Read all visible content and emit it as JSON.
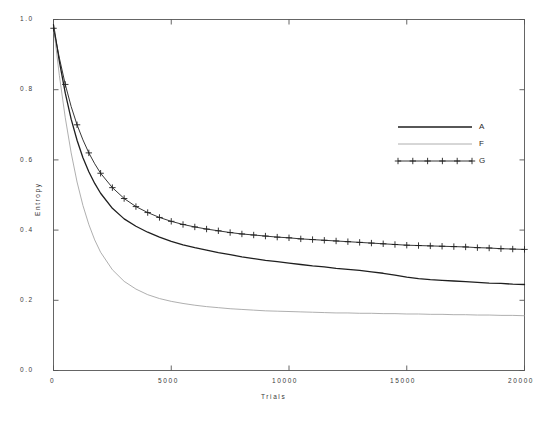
{
  "chart_data": {
    "type": "line",
    "title": "",
    "xlabel": "Trials",
    "ylabel": "Entropy",
    "xlim": [
      0,
      20000
    ],
    "ylim": [
      0.0,
      1.0
    ],
    "xticks": [
      0,
      5000,
      10000,
      15000,
      20000
    ],
    "xtick_labels": [
      "0",
      "5000",
      "10000",
      "15000",
      "20000"
    ],
    "yticks": [
      0.0,
      0.2,
      0.4,
      0.6,
      0.8,
      1.0
    ],
    "ytick_labels": [
      "0.0",
      "0.2",
      "0.4",
      "0.6",
      "0.8",
      "1.0"
    ],
    "grid": false,
    "legend_position": "upper right",
    "frame": true,
    "x": [
      0,
      250,
      500,
      750,
      1000,
      1250,
      1500,
      1750,
      2000,
      2500,
      3000,
      3500,
      4000,
      4500,
      5000,
      5500,
      6000,
      6500,
      7000,
      7500,
      8000,
      8500,
      9000,
      9500,
      10000,
      10500,
      11000,
      11500,
      12000,
      12500,
      13000,
      13500,
      14000,
      14500,
      15000,
      15500,
      16000,
      16500,
      17000,
      17500,
      18000,
      18500,
      19000,
      19500,
      20000
    ],
    "series": [
      {
        "name": "A",
        "style": "solid",
        "color": "#1f1f1f",
        "width": 1.3,
        "marker": "none",
        "values": [
          0.985,
          0.88,
          0.79,
          0.716,
          0.656,
          0.606,
          0.566,
          0.533,
          0.505,
          0.462,
          0.432,
          0.411,
          0.394,
          0.38,
          0.368,
          0.358,
          0.35,
          0.343,
          0.336,
          0.33,
          0.324,
          0.319,
          0.314,
          0.31,
          0.306,
          0.302,
          0.298,
          0.295,
          0.291,
          0.288,
          0.285,
          0.281,
          0.277,
          0.272,
          0.266,
          0.262,
          0.259,
          0.257,
          0.255,
          0.253,
          0.251,
          0.249,
          0.248,
          0.246,
          0.245
        ]
      },
      {
        "name": "F",
        "style": "solid",
        "color": "#9a9a9a",
        "width": 0.8,
        "marker": "none",
        "values": [
          0.98,
          0.84,
          0.72,
          0.62,
          0.537,
          0.47,
          0.416,
          0.372,
          0.337,
          0.287,
          0.254,
          0.232,
          0.216,
          0.205,
          0.197,
          0.191,
          0.186,
          0.182,
          0.179,
          0.176,
          0.174,
          0.172,
          0.17,
          0.169,
          0.168,
          0.167,
          0.166,
          0.165,
          0.164,
          0.164,
          0.163,
          0.163,
          0.162,
          0.162,
          0.161,
          0.161,
          0.16,
          0.16,
          0.159,
          0.159,
          0.158,
          0.158,
          0.157,
          0.157,
          0.156
        ]
      },
      {
        "name": "G",
        "style": "solid",
        "color": "#1f1f1f",
        "width": 0.9,
        "marker": "plus",
        "values": [
          0.975,
          0.89,
          0.815,
          0.752,
          0.7,
          0.657,
          0.62,
          0.589,
          0.562,
          0.521,
          0.49,
          0.467,
          0.45,
          0.436,
          0.425,
          0.416,
          0.409,
          0.403,
          0.398,
          0.393,
          0.389,
          0.386,
          0.383,
          0.38,
          0.378,
          0.375,
          0.373,
          0.371,
          0.369,
          0.367,
          0.365,
          0.363,
          0.361,
          0.359,
          0.357,
          0.356,
          0.355,
          0.354,
          0.353,
          0.352,
          0.35,
          0.349,
          0.347,
          0.346,
          0.345
        ]
      }
    ]
  },
  "legend": {
    "entries": [
      {
        "label": "A",
        "key": "A"
      },
      {
        "label": "F",
        "key": "F"
      },
      {
        "label": "G",
        "key": "G"
      }
    ]
  }
}
